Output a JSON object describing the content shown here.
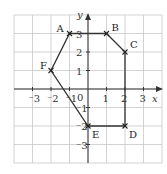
{
  "diagram": {
    "type": "coordinate-grid-polygon",
    "origin_px": [
      88,
      89
    ],
    "unit_px": 18.5,
    "grid_range": {
      "x": [
        -4,
        4
      ],
      "y": [
        -4,
        4
      ]
    },
    "axes": {
      "x_label": "x",
      "y_label": "y",
      "origin_label": "0",
      "x_ticks": [
        {
          "value": -3,
          "label": "⁻3"
        },
        {
          "value": -2,
          "label": "⁻2"
        },
        {
          "value": -1,
          "label": "⁻1"
        },
        {
          "value": 1,
          "label": "1"
        },
        {
          "value": 2,
          "label": "2"
        },
        {
          "value": 3,
          "label": "3"
        }
      ],
      "y_ticks": [
        {
          "value": 3,
          "label": "3"
        },
        {
          "value": 2,
          "label": "2"
        },
        {
          "value": 1,
          "label": "1"
        },
        {
          "value": -1,
          "label": "⁻1"
        },
        {
          "value": -2,
          "label": "⁻2"
        },
        {
          "value": -3,
          "label": "⁻3"
        }
      ]
    },
    "points": [
      {
        "name": "A",
        "x": -1,
        "y": 3
      },
      {
        "name": "B",
        "x": 1,
        "y": 3
      },
      {
        "name": "C",
        "x": 2,
        "y": 2
      },
      {
        "name": "D",
        "x": 2,
        "y": -2
      },
      {
        "name": "E",
        "x": 0,
        "y": -2
      },
      {
        "name": "F",
        "x": -2,
        "y": 1
      }
    ],
    "polygon_order": [
      "A",
      "B",
      "C",
      "D",
      "E",
      "F"
    ],
    "colors": {
      "line": "#333333",
      "grid": "#c8c8c8",
      "background": "#ffffff"
    }
  }
}
